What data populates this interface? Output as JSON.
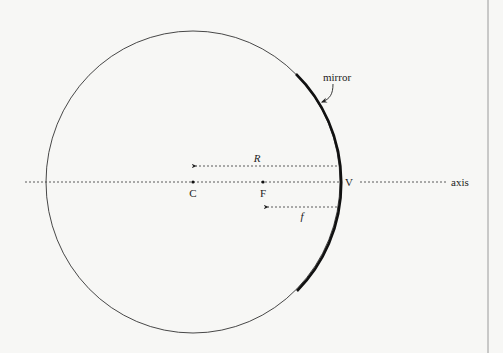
{
  "diagram": {
    "labels": {
      "mirror": "mirror",
      "center": "C",
      "focal_point": "F",
      "vertex": "V",
      "axis": "axis",
      "radius": "R",
      "focal_length": "f"
    },
    "colors": {
      "background": "#f7f7f5",
      "ink": "#222222",
      "border": "#9a9a9a"
    },
    "geometry": {
      "circle_center": [
        193,
        182
      ],
      "circle_radius_x": 147,
      "circle_radius_y": 151,
      "center_point_C": [
        193,
        182
      ],
      "focal_point_F": [
        263,
        182
      ],
      "vertex_V": [
        340,
        182
      ],
      "axis_y": 182,
      "axis_extent_x": [
        25,
        446
      ],
      "radius_arrow": {
        "from": [
          337,
          166
        ],
        "to": [
          194,
          166
        ]
      },
      "focal_arrow": {
        "from": [
          337,
          207
        ],
        "to": [
          266,
          207
        ]
      },
      "mirror_arc_top": [
        296,
        74
      ],
      "mirror_arc_bottom": [
        297,
        291
      ],
      "right_border_x": 488
    }
  }
}
